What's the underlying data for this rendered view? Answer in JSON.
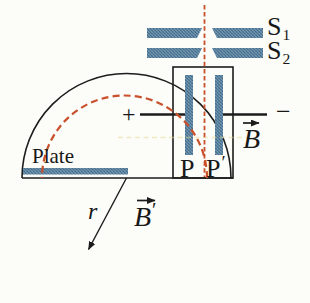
{
  "figure": {
    "labels": {
      "s1": {
        "main": "S",
        "sub": "1"
      },
      "s2": {
        "main": "S",
        "sub": "2"
      },
      "plate": "Plate",
      "p": "P",
      "p_prime": {
        "main": "P",
        "prime": "′"
      },
      "b": {
        "main": "B"
      },
      "b_prime": {
        "main": "B",
        "prime": "′"
      },
      "r": "r",
      "plus": "+",
      "minus": "−"
    },
    "colors": {
      "line": "#1c1c1c",
      "beam_dashed": "#c8502b",
      "hatch_base": "#83a3b8",
      "hatch_dark": "#33607f",
      "artifact_yellow": "#e9d892",
      "background": "#fcfcf9"
    }
  }
}
